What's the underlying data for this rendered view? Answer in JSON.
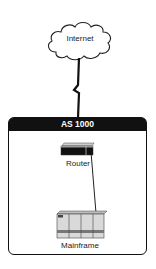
{
  "diagram": {
    "cloud": {
      "label": "Internet",
      "icon": "cloud-icon"
    },
    "wan_link": {
      "style": "lightning-zigzag",
      "from": "Internet",
      "to": "AS 1000"
    },
    "autonomous_system": {
      "title": "AS 1000",
      "header_color": "#111111",
      "nodes": [
        {
          "id": "router",
          "label": "Router",
          "icon": "router-icon"
        },
        {
          "id": "mainframe",
          "label": "Mainframe",
          "icon": "mainframe-icon"
        }
      ],
      "links": [
        {
          "from": "router",
          "to": "mainframe"
        }
      ]
    }
  }
}
